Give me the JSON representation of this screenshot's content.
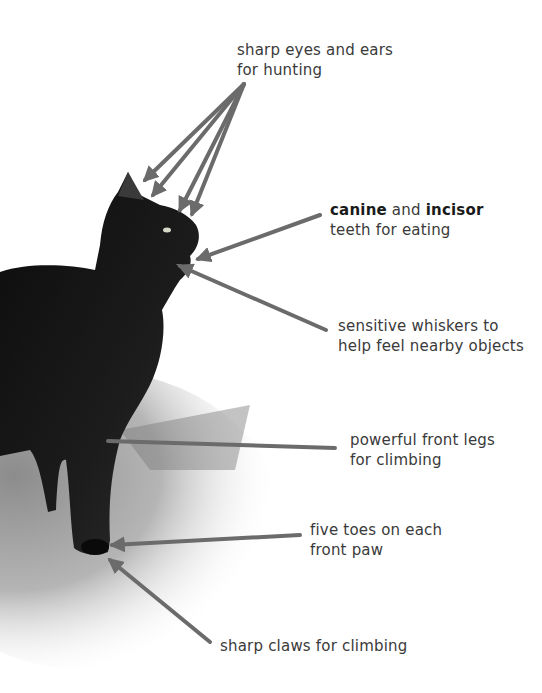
{
  "figure": {
    "arrow_color": "#6b6b6b",
    "text_color": "#3a3a3a"
  },
  "labels": {
    "eyes_ears": {
      "line1": "sharp eyes and ears",
      "line2": "for hunting"
    },
    "teeth": {
      "bold1": "canine",
      "mid": " and ",
      "bold2": "incisor",
      "line2": "teeth for eating"
    },
    "whiskers": {
      "line1": "sensitive whiskers to",
      "line2": "help feel nearby objects"
    },
    "legs": {
      "line1": "powerful front legs",
      "line2": "for climbing"
    },
    "toes": {
      "line1": "five toes on each",
      "line2": "front paw"
    },
    "claws": {
      "line1": "sharp claws for climbing"
    }
  }
}
